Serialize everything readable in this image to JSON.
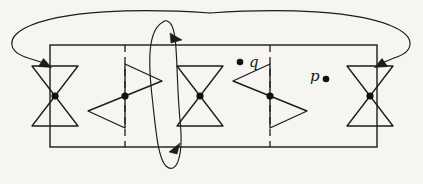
{
  "figure": {
    "background_color": "#f7f5f1",
    "ink_color": "#1c1c1c",
    "canvas": {
      "width": 423,
      "height": 184
    },
    "domain_rectangle": {
      "name": "fundamental-domain-rectangle",
      "x": 50,
      "y": 45,
      "width": 327,
      "height": 102,
      "stroke": "#2a2a2a"
    },
    "dashed_lines": [
      {
        "name": "dashed-line-left",
        "x": 125,
        "y1": 45,
        "y2": 147
      },
      {
        "name": "dashed-line-right",
        "x": 270,
        "y1": 45,
        "y2": 147
      }
    ],
    "singularities": [
      {
        "name": "bowtie-vertical-left-edge",
        "type": "vertical-bowtie",
        "cx": 55,
        "cy": 96,
        "half_width": 23,
        "half_height": 30
      },
      {
        "name": "bowtie-horizontal-left",
        "type": "horizontal-bowtie",
        "cx": 125,
        "cy": 96,
        "half_width": 34,
        "half_height": 30,
        "orientation": "top-right"
      },
      {
        "name": "bowtie-vertical-center",
        "type": "vertical-bowtie",
        "cx": 200,
        "cy": 96,
        "half_width": 23,
        "half_height": 30
      },
      {
        "name": "bowtie-horizontal-right",
        "type": "horizontal-bowtie",
        "cx": 270,
        "cy": 96,
        "half_width": 34,
        "half_height": 30,
        "orientation": "top-left"
      },
      {
        "name": "bowtie-vertical-right-edge",
        "type": "vertical-bowtie",
        "cx": 370,
        "cy": 96,
        "half_width": 23,
        "half_height": 30
      }
    ],
    "marked_points": [
      {
        "name": "point-q",
        "label": "q",
        "dot_x": 240,
        "dot_y": 62,
        "label_x": 249,
        "label_y": 62,
        "dot_side": "left"
      },
      {
        "name": "point-p",
        "label": "p",
        "dot_x": 326,
        "dot_y": 78,
        "label_x": 310,
        "label_y": 76,
        "dot_side": "right"
      }
    ],
    "arrows": {
      "horizontal_identification": {
        "name": "horizontal-identification-arc",
        "description": "large arc over the top joining right edge to left edge, arrowheads pointing inward at both vertical edges"
      },
      "vertical_identification": {
        "name": "vertical-identification-ellipse",
        "description": "tall ellipse through the middle, arrowhead down-right at top and up-right at bottom"
      }
    }
  }
}
